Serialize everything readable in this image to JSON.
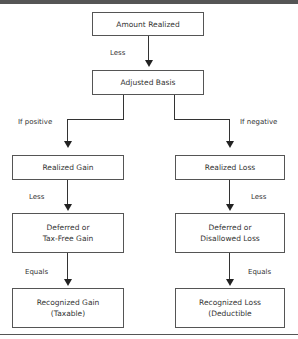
{
  "diagram": {
    "nodes": {
      "amount_realized": "Amount Realized",
      "adjusted_basis": "Adjusted Basis",
      "realized_gain": "Realized Gain",
      "realized_loss": "Realized Loss",
      "deferred_gain": "Deferred or\nTax-Free Gain",
      "deferred_loss": "Deferred or\nDisallowed Loss",
      "recognized_gain": "Recognized Gain\n(Taxable)",
      "recognized_loss": "Recognized Loss\n(Deductible"
    },
    "edges": {
      "less_top": "Less",
      "if_positive": "If positive",
      "if_negative": "If negative",
      "less_left": "Less",
      "less_right": "Less",
      "equals_left": "Equals",
      "equals_right": "Equals"
    },
    "colors": {
      "border": "#555555",
      "arrow": "#222222",
      "text": "#333333"
    }
  }
}
